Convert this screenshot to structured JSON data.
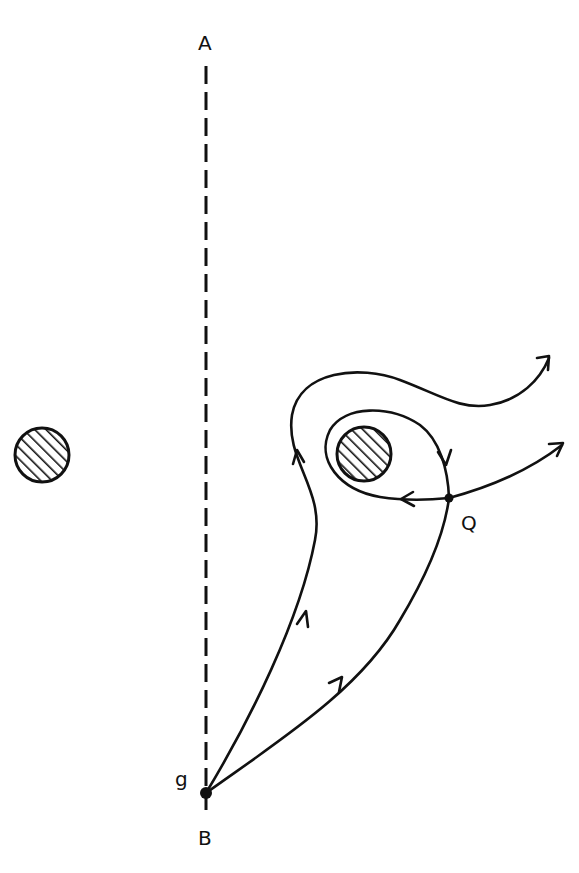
{
  "diagram": {
    "labels": {
      "top": "A",
      "bottom": "B",
      "origin": "g",
      "saddle": "Q"
    },
    "obstacles": [
      {
        "name": "left-obstacle",
        "cx": 42,
        "cy": 455,
        "r": 28
      },
      {
        "name": "center-obstacle",
        "cx": 364,
        "cy": 454,
        "r": 28
      }
    ],
    "colors": {
      "stroke": "#111111",
      "background": "#ffffff"
    }
  }
}
